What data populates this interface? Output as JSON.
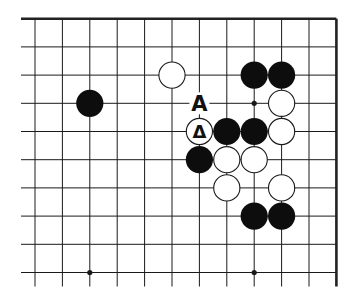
{
  "diagram": {
    "type": "go-board-fragment",
    "corner": "top-right",
    "columns": 12,
    "rows": 10,
    "origin": {
      "x": 35,
      "y": 18.7
    },
    "spacing": {
      "x": 27.4,
      "y": 28.2
    },
    "edges": {
      "top": true,
      "right": true,
      "left": false,
      "bottom": false
    },
    "hoshi": [
      [
        2,
        9
      ],
      [
        8,
        3
      ],
      [
        8,
        9
      ]
    ],
    "stones": [
      {
        "color": "black",
        "col": 2,
        "row": 3
      },
      {
        "color": "white",
        "col": 5,
        "row": 2
      },
      {
        "color": "black",
        "col": 8,
        "row": 2
      },
      {
        "color": "black",
        "col": 9,
        "row": 2
      },
      {
        "color": "white",
        "col": 9,
        "row": 3
      },
      {
        "color": "white",
        "col": 6,
        "row": 4,
        "mark": "triangle"
      },
      {
        "color": "black",
        "col": 7,
        "row": 4
      },
      {
        "color": "black",
        "col": 8,
        "row": 4
      },
      {
        "color": "white",
        "col": 9,
        "row": 4
      },
      {
        "color": "black",
        "col": 6,
        "row": 5
      },
      {
        "color": "white",
        "col": 7,
        "row": 5
      },
      {
        "color": "white",
        "col": 8,
        "row": 5
      },
      {
        "color": "white",
        "col": 7,
        "row": 6
      },
      {
        "color": "white",
        "col": 9,
        "row": 6
      },
      {
        "color": "black",
        "col": 8,
        "row": 7
      },
      {
        "color": "black",
        "col": 9,
        "row": 7
      }
    ],
    "labels": [
      {
        "text": "A",
        "col": 6,
        "row": 3
      }
    ],
    "triangle_glyph": "Δ",
    "colors": {
      "line": "#1a1a1a",
      "black": "#0d0d0d",
      "white": "#ffffff",
      "edge": "#222222"
    }
  }
}
